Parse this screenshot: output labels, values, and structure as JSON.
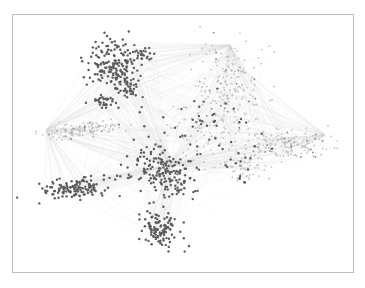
{
  "figure": {
    "type": "network-graph",
    "frame": {
      "x": 12,
      "y": 14,
      "width": 342,
      "height": 259,
      "border_color": "#bdbdbd"
    },
    "colors": {
      "dark_node": "#5c5c5c",
      "mid_node": "#8a8a8a",
      "light_node": "#c4c4c4",
      "edge": "#d6d6d6",
      "background": "#ffffff"
    },
    "clusters": [
      {
        "name": "top-left-cluster",
        "cx": 112,
        "cy": 62,
        "rx": 22,
        "ry": 24,
        "count": 140,
        "tone": "dark",
        "angle": 35
      },
      {
        "name": "top-left-tail",
        "cx": 128,
        "cy": 85,
        "rx": 12,
        "ry": 20,
        "count": 60,
        "tone": "dark",
        "angle": -20
      },
      {
        "name": "top-left-satellite",
        "cx": 142,
        "cy": 55,
        "rx": 8,
        "ry": 8,
        "count": 25,
        "tone": "dark",
        "angle": 0
      },
      {
        "name": "upper-left-small",
        "cx": 105,
        "cy": 102,
        "rx": 12,
        "ry": 6,
        "count": 30,
        "tone": "dark",
        "angle": 0
      },
      {
        "name": "left-arm",
        "cx": 82,
        "cy": 130,
        "rx": 38,
        "ry": 6,
        "count": 120,
        "tone": "light",
        "angle": -8
      },
      {
        "name": "top-right-fan",
        "cx": 230,
        "cy": 85,
        "rx": 30,
        "ry": 42,
        "count": 180,
        "tone": "light",
        "angle": 0
      },
      {
        "name": "right-arm",
        "cx": 285,
        "cy": 145,
        "rx": 40,
        "ry": 13,
        "count": 170,
        "tone": "light",
        "angle": -5
      },
      {
        "name": "center-cluster",
        "cx": 163,
        "cy": 172,
        "rx": 30,
        "ry": 22,
        "count": 170,
        "tone": "dark",
        "angle": 30
      },
      {
        "name": "bottom-left-arm",
        "cx": 75,
        "cy": 188,
        "rx": 32,
        "ry": 9,
        "count": 130,
        "tone": "dark",
        "angle": -5
      },
      {
        "name": "bottom-cluster",
        "cx": 160,
        "cy": 230,
        "rx": 18,
        "ry": 16,
        "count": 110,
        "tone": "dark",
        "angle": 30
      },
      {
        "name": "center-sparse",
        "cx": 200,
        "cy": 130,
        "rx": 45,
        "ry": 35,
        "count": 120,
        "tone": "mixed",
        "angle": 0
      },
      {
        "name": "right-lower-sparse",
        "cx": 245,
        "cy": 168,
        "rx": 28,
        "ry": 14,
        "count": 60,
        "tone": "mixed",
        "angle": 10
      }
    ],
    "hubs": [
      {
        "name": "top-right-hub",
        "x": 230,
        "y": 45
      },
      {
        "name": "left-arm-tip",
        "x": 46,
        "y": 130
      },
      {
        "name": "right-arm-tip",
        "x": 325,
        "y": 135
      },
      {
        "name": "center-hub",
        "x": 170,
        "y": 165
      }
    ],
    "seed": 12345
  }
}
